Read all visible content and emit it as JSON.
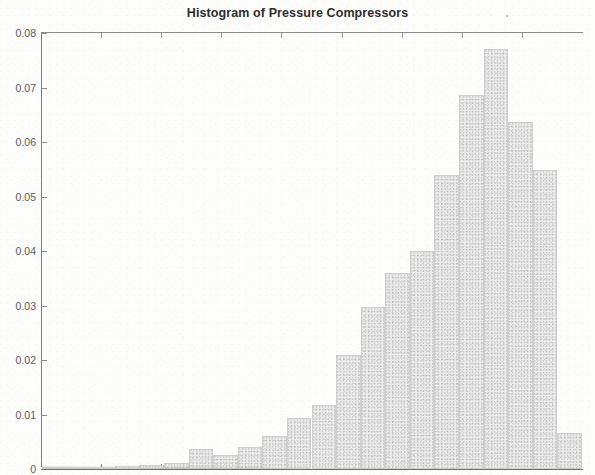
{
  "figure": {
    "title": "Histogram of Pressure Compressors",
    "background_color": "#fdfdfc",
    "bar_fill_color": "#eaeaea",
    "bar_edge_color": "#cfcfcf",
    "axis_color": "#7d7d7d",
    "title_color": "#2e2e2e",
    "tick_label_color": "#5a5a5a"
  },
  "chart_data": {
    "type": "bar",
    "title": "Histogram of Pressure Compressors",
    "xlabel": "",
    "ylabel": "",
    "ylim": [
      0,
      0.08
    ],
    "yticks": [
      0,
      0.01,
      0.02,
      0.03,
      0.04,
      0.05,
      0.06,
      0.07,
      0.08
    ],
    "ytick_labels": [
      "0",
      "0.01",
      "0.02",
      "0.03",
      "0.04",
      "0.05",
      "0.06",
      "0.07",
      "0.08"
    ],
    "xticks_labeled": false,
    "xtick_labels": [],
    "grid": false,
    "legend": null,
    "bin_count": 22,
    "categories": [
      "bin1",
      "bin2",
      "bin3",
      "bin4",
      "bin5",
      "bin6",
      "bin7",
      "bin8",
      "bin9",
      "bin10",
      "bin11",
      "bin12",
      "bin13",
      "bin14",
      "bin15",
      "bin16",
      "bin17",
      "bin18",
      "bin19",
      "bin20",
      "bin21",
      "bin22"
    ],
    "values": [
      0.0002,
      0.0003,
      0.0004,
      0.0005,
      0.0007,
      0.0011,
      0.0037,
      0.0026,
      0.004,
      0.006,
      0.0094,
      0.0118,
      0.021,
      0.0297,
      0.036,
      0.04,
      0.054,
      0.0686,
      0.077,
      0.0637,
      0.0548,
      0.0067
    ]
  }
}
